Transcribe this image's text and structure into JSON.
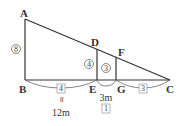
{
  "diagram": {
    "points": {
      "A": {
        "label": "A",
        "x": 25,
        "y": 19
      },
      "B": {
        "label": "B",
        "x": 25,
        "y": 80
      },
      "C": {
        "label": "C",
        "x": 170,
        "y": 80
      },
      "D": {
        "label": "D",
        "x": 97,
        "y": 48
      },
      "E": {
        "label": "E",
        "x": 97,
        "y": 80
      },
      "F": {
        "label": "F",
        "x": 116,
        "y": 57
      },
      "G": {
        "label": "G",
        "x": 116,
        "y": 80
      }
    },
    "ratios": {
      "AB": "8",
      "DE": "4",
      "FG": "3",
      "BE": "4",
      "EG": "1",
      "GC": "3"
    },
    "lengths": {
      "BE_equals": "॥",
      "BE": "12m",
      "EG": "3m"
    },
    "colors": {
      "line": "#333333",
      "text": "#333333",
      "box_border": "#999999"
    }
  }
}
